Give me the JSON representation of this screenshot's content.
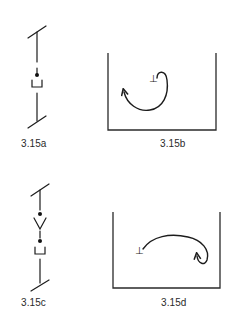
{
  "figure": {
    "panels": [
      {
        "id": "a",
        "label": "3.15a",
        "kind": "side-view-schematic",
        "elements": [
          "top-surface-line",
          "vertical-line",
          "solute-atom-dot",
          "vacancy-cup",
          "bottom-surface-line"
        ]
      },
      {
        "id": "b",
        "label": "3.15b",
        "kind": "container-with-loop-path",
        "elements": [
          "dislocation-symbol",
          "curved-arrow-clockwise-loop"
        ]
      },
      {
        "id": "c",
        "label": "3.15c",
        "kind": "side-view-schematic",
        "elements": [
          "top-surface-line",
          "vertical-line",
          "dot",
          "v-shape",
          "dot",
          "vacancy-cup",
          "bottom-surface-line"
        ]
      },
      {
        "id": "d",
        "label": "3.15d",
        "kind": "container-with-loop-path",
        "elements": [
          "dislocation-symbol",
          "curved-arrow-hook"
        ]
      }
    ],
    "symbols": {
      "dislocation": "⊥"
    },
    "colors": {
      "ink": "#1c1c1c",
      "background": "#ffffff",
      "label": "#2b2b2b"
    }
  }
}
